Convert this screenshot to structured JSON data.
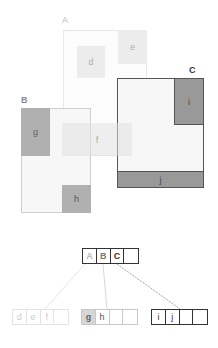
{
  "diagram": {
    "type": "r-tree",
    "regions": [
      {
        "id": "A",
        "label": "A",
        "level": "internal",
        "children": [
          "d",
          "e",
          "f"
        ]
      },
      {
        "id": "B",
        "label": "B",
        "level": "internal",
        "children": [
          "g",
          "h"
        ]
      },
      {
        "id": "C",
        "label": "C",
        "level": "internal",
        "children": [
          "i",
          "j"
        ]
      }
    ],
    "leaves": [
      {
        "id": "d",
        "label": "d"
      },
      {
        "id": "e",
        "label": "e"
      },
      {
        "id": "f",
        "label": "f"
      },
      {
        "id": "g",
        "label": "g"
      },
      {
        "id": "h",
        "label": "h"
      },
      {
        "id": "i",
        "label": "i"
      },
      {
        "id": "j",
        "label": "j"
      }
    ],
    "tree": {
      "root": {
        "cells": [
          "A",
          "B",
          "C",
          ""
        ]
      },
      "children": [
        {
          "parent": "A",
          "cells": [
            "d",
            "e",
            "f",
            ""
          ]
        },
        {
          "parent": "B",
          "cells": [
            "g",
            "h",
            "",
            ""
          ]
        },
        {
          "parent": "C",
          "cells": [
            "i",
            "j",
            "",
            ""
          ]
        }
      ]
    }
  }
}
